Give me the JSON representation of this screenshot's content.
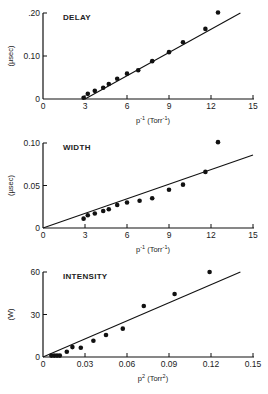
{
  "chart_data": [
    {
      "type": "scatter",
      "title": "DELAY",
      "xlabel": "p⁻¹ (Torr⁻¹)",
      "ylabel": "(µsec)",
      "xlim": [
        0,
        15
      ],
      "ylim": [
        0,
        0.2
      ],
      "xticks": [
        "0",
        "3",
        "6",
        "9",
        "12",
        "15"
      ],
      "yticks": [
        "0",
        "0.10",
        ".20"
      ],
      "grid": false,
      "series": [
        {
          "name": "measured",
          "x": [
            2.9,
            3.2,
            3.7,
            4.3,
            4.7,
            5.3,
            6.0,
            6.8,
            7.8,
            9.0,
            10.0,
            11.6,
            12.5
          ],
          "y": [
            0.003,
            0.012,
            0.019,
            0.026,
            0.035,
            0.047,
            0.059,
            0.067,
            0.088,
            0.109,
            0.132,
            0.163,
            0.201
          ]
        },
        {
          "name": "fit line",
          "x": [
            3.0,
            14.1
          ],
          "y": [
            0.0,
            0.2
          ]
        }
      ]
    },
    {
      "type": "scatter",
      "title": "WIDTH",
      "xlabel": "p⁻¹ (Torr⁻¹)",
      "ylabel": "(µsec)",
      "xlim": [
        0,
        15
      ],
      "ylim": [
        0,
        0.1
      ],
      "xticks": [
        "0",
        "3",
        "6",
        "9",
        "12",
        "15"
      ],
      "yticks": [
        "0",
        "0.05",
        "0.10"
      ],
      "grid": false,
      "series": [
        {
          "name": "measured",
          "x": [
            2.9,
            3.2,
            3.7,
            4.3,
            4.7,
            5.3,
            6.0,
            6.9,
            7.8,
            9.0,
            10.0,
            11.6,
            12.5
          ],
          "y": [
            0.011,
            0.015,
            0.017,
            0.02,
            0.022,
            0.027,
            0.03,
            0.032,
            0.035,
            0.045,
            0.051,
            0.066,
            0.101
          ]
        },
        {
          "name": "fit line",
          "x": [
            0,
            15
          ],
          "y": [
            0.0,
            0.086
          ]
        }
      ]
    },
    {
      "type": "scatter",
      "title": "INTENSITY",
      "xlabel": "p² (Torr²)",
      "ylabel": "(W)",
      "xlim": [
        0,
        0.15
      ],
      "ylim": [
        0,
        60
      ],
      "xticks": [
        "0",
        "0.03",
        "0.06",
        "0.09",
        "0.12",
        "0.15"
      ],
      "yticks": [
        "0",
        "30",
        "60"
      ],
      "grid": false,
      "series": [
        {
          "name": "measured",
          "x": [
            0.006,
            0.008,
            0.01,
            0.012,
            0.017,
            0.021,
            0.027,
            0.036,
            0.045,
            0.057,
            0.072,
            0.094,
            0.119
          ],
          "y": [
            1.0,
            1.0,
            1.0,
            1.0,
            3.7,
            7.0,
            6.5,
            11.5,
            15.5,
            20.0,
            36.0,
            44.5,
            60.0
          ]
        },
        {
          "name": "fit line",
          "x": [
            0,
            0.141
          ],
          "y": [
            0,
            60
          ]
        }
      ]
    }
  ],
  "panels": [
    {
      "title": "DELAY",
      "ylabel": "(µsec)",
      "xlabel_base": "p",
      "xlabel_exp": "-1",
      "xlabel_unit": "(Torr",
      "xlabel_unit_exp": "-1",
      "xlabel_close": ")"
    },
    {
      "title": "WIDTH",
      "ylabel": "(µsec)",
      "xlabel_base": "p",
      "xlabel_exp": "-1",
      "xlabel_unit": "(Torr",
      "xlabel_unit_exp": "-1",
      "xlabel_close": ")"
    },
    {
      "title": "INTENSITY",
      "ylabel": "(W)",
      "xlabel_base": "p",
      "xlabel_exp": "2",
      "xlabel_unit": "(Torr",
      "xlabel_unit_exp": "2",
      "xlabel_close": ")"
    }
  ]
}
